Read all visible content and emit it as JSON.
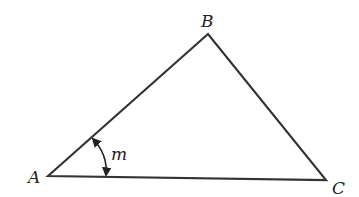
{
  "diagram": {
    "type": "triangle",
    "vertices": [
      {
        "label": "A",
        "x": 48,
        "y": 176
      },
      {
        "label": "B",
        "x": 208,
        "y": 34
      },
      {
        "label": "C",
        "x": 326,
        "y": 180
      }
    ],
    "angle_mark": {
      "vertex": "A",
      "label": "m"
    },
    "stroke_color": "#333333"
  }
}
